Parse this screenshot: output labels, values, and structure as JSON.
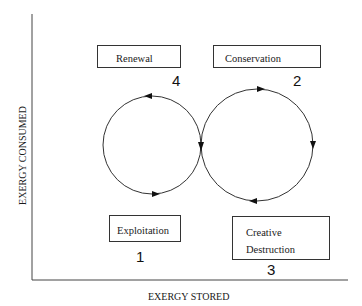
{
  "diagram": {
    "type": "adaptive-cycle",
    "axes": {
      "x_label": "EXERGY STORED",
      "y_label": "EXERGY CONSUMED"
    },
    "phases": [
      {
        "id": "renewal",
        "label": "Renewal",
        "number": "4"
      },
      {
        "id": "conservation",
        "label": "Conservation",
        "number": "2"
      },
      {
        "id": "exploitation",
        "label": "Exploitation",
        "number": "1"
      },
      {
        "id": "creative-destruction",
        "label_line1": "Creative",
        "label_line2": "Destruction",
        "number": "3"
      }
    ],
    "loops": [
      {
        "id": "left-loop",
        "direction": "counter-clockwise"
      },
      {
        "id": "right-loop",
        "direction": "clockwise"
      }
    ],
    "colors": {
      "line": "#333333",
      "background": "#ffffff"
    }
  }
}
